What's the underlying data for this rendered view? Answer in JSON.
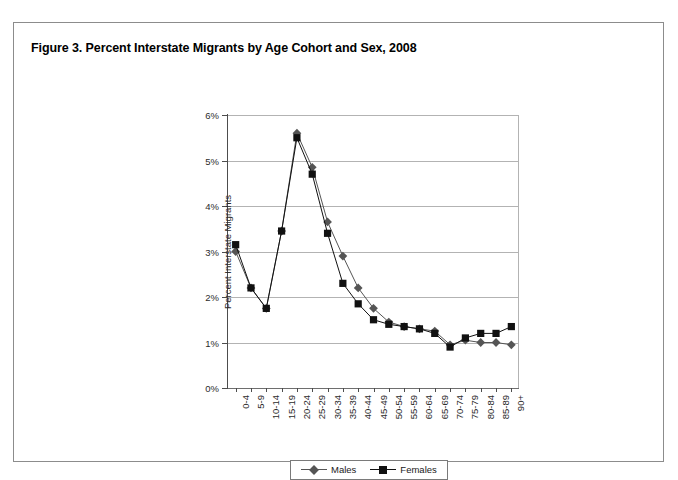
{
  "figure": {
    "title": "Figure 3. Percent Interstate Migrants by Age Cohort and Sex, 2008"
  },
  "legend": {
    "position": "bottom-center",
    "entries": [
      {
        "label": "Males",
        "marker": "diamond-marker-icon",
        "color": "#555555"
      },
      {
        "label": "Females",
        "marker": "square-marker-icon",
        "color": "#111111"
      }
    ]
  },
  "chart_data": {
    "type": "line",
    "title": "Figure 3. Percent Interstate Migrants by Age Cohort and Sex, 2008",
    "xlabel": "Age Group",
    "ylabel": "Percent Interstate Migrants",
    "ylim": [
      0,
      6
    ],
    "ytick_labels": [
      "0%",
      "1%",
      "2%",
      "3%",
      "4%",
      "5%",
      "6%"
    ],
    "ytick_values": [
      0,
      1,
      2,
      3,
      4,
      5,
      6
    ],
    "grid": "horizontal",
    "categories": [
      "0-4",
      "5-9",
      "10-14",
      "15-19",
      "20-24",
      "25-29",
      "30-34",
      "35-39",
      "40-44",
      "45-49",
      "50-54",
      "55-59",
      "60-64",
      "65-69",
      "70-74",
      "75-79",
      "80-84",
      "85-89",
      "90+"
    ],
    "series": [
      {
        "name": "Males",
        "marker": "diamond",
        "color": "#555555",
        "values": [
          3.0,
          2.2,
          1.75,
          3.45,
          5.6,
          4.85,
          3.65,
          2.9,
          2.2,
          1.75,
          1.45,
          1.35,
          1.3,
          1.25,
          0.95,
          1.05,
          1.0,
          1.0,
          0.95
        ]
      },
      {
        "name": "Females",
        "marker": "square",
        "color": "#111111",
        "values": [
          3.15,
          2.2,
          1.75,
          3.45,
          5.5,
          4.7,
          3.4,
          2.3,
          1.85,
          1.5,
          1.4,
          1.35,
          1.3,
          1.2,
          0.9,
          1.1,
          1.2,
          1.2,
          1.35
        ]
      }
    ]
  }
}
